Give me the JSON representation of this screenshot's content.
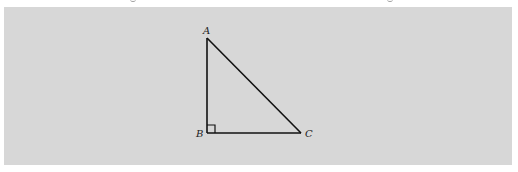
{
  "figure": {
    "type": "right-triangle",
    "background_color": "#d7d7d7",
    "stroke_color": "#111111",
    "vertices": [
      {
        "label": "A",
        "x": 207,
        "y": 38
      },
      {
        "label": "B",
        "x": 207,
        "y": 133
      },
      {
        "label": "C",
        "x": 301,
        "y": 133
      }
    ],
    "right_angle_at": "B",
    "labels": {
      "a": "A",
      "b": "B",
      "c": "C"
    }
  }
}
